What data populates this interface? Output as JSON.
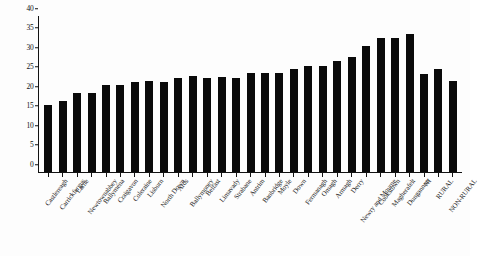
{
  "chart_data": {
    "type": "bar",
    "title": "",
    "subtitle": "",
    "xlabel": "",
    "ylabel": "",
    "ylim": [
      0,
      40
    ],
    "yticks": [
      0,
      5,
      10,
      15,
      20,
      25,
      30,
      35,
      40
    ],
    "grid": false,
    "legend": null,
    "bar_color": "#0a0a0a",
    "background_color": "#ffffff",
    "axis_color": "#121212",
    "categories": [
      "Castlereagh",
      "Carrickfergus",
      "Larne",
      "Newtownabbey",
      "Ballymena",
      "Craigavon",
      "Coleraine",
      "Lisburn",
      "North Down",
      "Ards",
      "Ballymoney",
      "Belfast",
      "Limavady",
      "Strabane",
      "Antrim",
      "Banbridge",
      "Moyle",
      "Down",
      "Fermanagh",
      "Omagh",
      "Armagh",
      "Derry",
      "Newry and Mourne",
      "Cookstown",
      "Magherafelt",
      "Dungannon",
      "NI",
      "RURAL",
      "NON-RURAL"
    ],
    "values": [
      17.2,
      18.3,
      20.2,
      20.2,
      22.3,
      22.2,
      23.2,
      23.3,
      23.2,
      24.2,
      24.6,
      24.2,
      24.3,
      24.2,
      25.3,
      25.3,
      25.3,
      26.5,
      27.3,
      27.3,
      28.4,
      29.4,
      32.3,
      34.3,
      34.4,
      35.3,
      25.2,
      26.4,
      23.3
    ]
  }
}
